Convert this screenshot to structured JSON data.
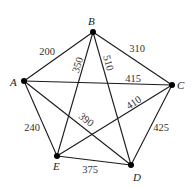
{
  "diagram": {
    "type": "weighted-complete-graph",
    "vertices": [
      {
        "id": "A",
        "label": "A",
        "x": 24,
        "y": 81,
        "lx": 10,
        "ly": 86
      },
      {
        "id": "B",
        "label": "B",
        "x": 93,
        "y": 32,
        "lx": 88,
        "ly": 25
      },
      {
        "id": "C",
        "label": "C",
        "x": 172,
        "y": 85,
        "lx": 177,
        "ly": 89
      },
      {
        "id": "D",
        "label": "D",
        "x": 131,
        "y": 165,
        "lx": 133,
        "ly": 181
      },
      {
        "id": "E",
        "label": "E",
        "x": 57,
        "y": 156,
        "lx": 53,
        "ly": 170
      }
    ],
    "edges": [
      {
        "from": "A",
        "to": "B",
        "weight": "200",
        "lx": 47,
        "ly": 55,
        "rot": 0
      },
      {
        "from": "B",
        "to": "C",
        "weight": "310",
        "lx": 137,
        "ly": 52,
        "rot": 0
      },
      {
        "from": "B",
        "to": "E",
        "weight": "350",
        "lx": 78,
        "ly": 68,
        "rot": -72
      },
      {
        "from": "B",
        "to": "D",
        "weight": "510",
        "lx": 108,
        "ly": 66,
        "rot": 75
      },
      {
        "from": "A",
        "to": "C",
        "weight": "415",
        "lx": 133,
        "ly": 82,
        "rot": 0
      },
      {
        "from": "E",
        "to": "C",
        "weight": "410",
        "lx": 134,
        "ly": 106,
        "rot": -33
      },
      {
        "from": "A",
        "to": "D",
        "weight": "390",
        "lx": 86,
        "ly": 123,
        "rot": 38
      },
      {
        "from": "A",
        "to": "E",
        "weight": "240",
        "lx": 32,
        "ly": 131,
        "rot": 0
      },
      {
        "from": "C",
        "to": "D",
        "weight": "425",
        "lx": 161,
        "ly": 131,
        "rot": 0
      },
      {
        "from": "E",
        "to": "D",
        "weight": "375",
        "lx": 90,
        "ly": 173,
        "rot": 0
      }
    ],
    "colors": {
      "edge": "#1a1a1a",
      "node": "#000000",
      "text": "#222222"
    }
  }
}
